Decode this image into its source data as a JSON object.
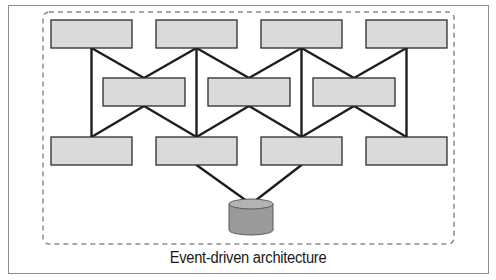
{
  "diagram": {
    "caption": "Event-driven architecture",
    "colors": {
      "box_fill": "#dadada",
      "box_stroke": "#2b2b2b",
      "line": "#1e1e1e",
      "dashed_border": "#8a8a8a",
      "frame_border": "#8c8c8c",
      "db_fill": "#9a9a9a",
      "db_top": "#b3b3b3"
    },
    "nodes": {
      "top_row": [
        {
          "id": "top-1",
          "x": 51,
          "y": 20,
          "w": 81,
          "h": 28
        },
        {
          "id": "top-2",
          "x": 156,
          "y": 20,
          "w": 81,
          "h": 28
        },
        {
          "id": "top-3",
          "x": 261,
          "y": 20,
          "w": 81,
          "h": 28
        },
        {
          "id": "top-4",
          "x": 366,
          "y": 20,
          "w": 81,
          "h": 28
        }
      ],
      "middle_row": [
        {
          "id": "mid-1",
          "x": 103,
          "y": 78,
          "w": 82,
          "h": 28
        },
        {
          "id": "mid-2",
          "x": 208,
          "y": 78,
          "w": 82,
          "h": 28
        },
        {
          "id": "mid-3",
          "x": 313,
          "y": 78,
          "w": 82,
          "h": 28
        }
      ],
      "bottom_row": [
        {
          "id": "bot-1",
          "x": 51,
          "y": 137,
          "w": 81,
          "h": 28
        },
        {
          "id": "bot-2",
          "x": 156,
          "y": 137,
          "w": 81,
          "h": 28
        },
        {
          "id": "bot-3",
          "x": 261,
          "y": 137,
          "w": 81,
          "h": 28
        },
        {
          "id": "bot-4",
          "x": 366,
          "y": 137,
          "w": 81,
          "h": 28
        }
      ],
      "database": {
        "id": "event-store",
        "cx": 251,
        "top": 204,
        "rx": 22,
        "ry": 5,
        "height": 26
      }
    },
    "edges": [
      {
        "from": "top-1",
        "to": "bot-1"
      },
      {
        "from": "top-1",
        "to": "mid-1"
      },
      {
        "from": "top-2",
        "to": "mid-1"
      },
      {
        "from": "top-2",
        "to": "bot-2"
      },
      {
        "from": "top-2",
        "to": "mid-2"
      },
      {
        "from": "top-3",
        "to": "mid-2"
      },
      {
        "from": "top-3",
        "to": "bot-3"
      },
      {
        "from": "top-3",
        "to": "mid-3"
      },
      {
        "from": "top-4",
        "to": "mid-3"
      },
      {
        "from": "top-4",
        "to": "bot-4"
      },
      {
        "from": "mid-1",
        "to": "bot-1"
      },
      {
        "from": "mid-1",
        "to": "bot-2"
      },
      {
        "from": "mid-2",
        "to": "bot-2"
      },
      {
        "from": "mid-2",
        "to": "bot-3"
      },
      {
        "from": "mid-3",
        "to": "bot-3"
      },
      {
        "from": "mid-3",
        "to": "bot-4"
      },
      {
        "from": "bot-2",
        "to": "event-store"
      },
      {
        "from": "bot-3",
        "to": "event-store"
      }
    ],
    "boundary": {
      "x": 43,
      "y": 12,
      "w": 411,
      "h": 232,
      "style": "dashed"
    }
  }
}
